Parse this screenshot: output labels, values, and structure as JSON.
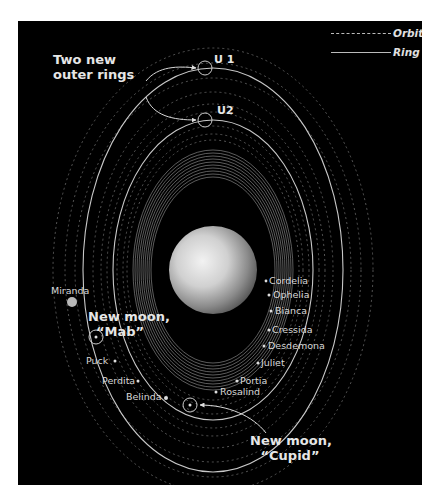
{
  "legend": {
    "items": [
      {
        "label": "Orbit",
        "style": "dashed"
      },
      {
        "label": "Ring",
        "style": "solid"
      }
    ]
  },
  "callouts": {
    "rings": {
      "line1": "Two new",
      "line2": "outer rings"
    },
    "mab": {
      "line1": "New moon,",
      "line2": "“Mab”"
    },
    "cupid": {
      "line1": "New moon,",
      "line2": "“Cupid”"
    }
  },
  "rings": {
    "u1": "U 1",
    "u2": "U2"
  },
  "moons": {
    "right": [
      "Cordelia",
      "Ophelia",
      "Bianca",
      "Cressida",
      "Desdemona",
      "Juliet",
      "Portia",
      "Rosalind"
    ],
    "left": [
      "Miranda",
      "Puck",
      "Perdita",
      "Belinda"
    ]
  },
  "colors": {
    "background": "#000000",
    "page": "#ffffff",
    "line": "#cfcfcf",
    "text": "#e0e0e0"
  }
}
